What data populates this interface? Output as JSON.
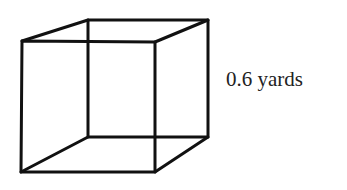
{
  "diagram": {
    "type": "cube-wireframe",
    "side_label": "0.6 yards",
    "colors": {
      "stroke": "#111111",
      "text": "#222222",
      "background": "#ffffff"
    },
    "vertices": {
      "front_top_left": [
        22,
        41
      ],
      "front_top_right": [
        155,
        42
      ],
      "front_bottom_left": [
        21,
        172
      ],
      "front_bottom_right": [
        155,
        172
      ],
      "back_top_left": [
        88,
        20
      ],
      "back_top_right": [
        208,
        20
      ],
      "back_bottom_left": [
        88,
        137
      ],
      "back_bottom_right": [
        208,
        137
      ]
    }
  }
}
